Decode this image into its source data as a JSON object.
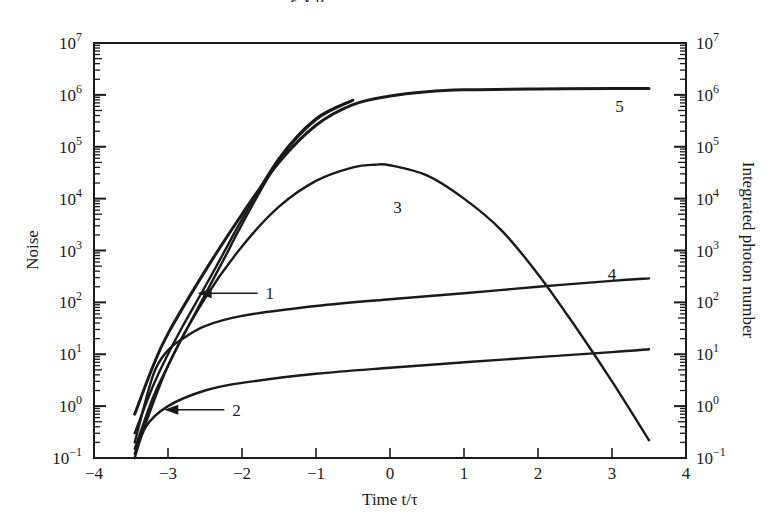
{
  "page": {
    "cut_caption": "g          y   p"
  },
  "chart_data": {
    "type": "line",
    "title": "",
    "xlabel": "Time t/τ",
    "ylabel": "Noise",
    "ylabel_right": "Integrated photon number",
    "xlim": [
      -4,
      4
    ],
    "ylim": [
      0.1,
      10000000
    ],
    "yscale": "log",
    "grid": false,
    "x_ticks": [
      "−4",
      "−3",
      "−2",
      "−1",
      "0",
      "1",
      "2",
      "3",
      "4"
    ],
    "y_ticks_left": [
      {
        "base": "10",
        "exp": "7"
      },
      {
        "base": "10",
        "exp": "6"
      },
      {
        "base": "10",
        "exp": "5"
      },
      {
        "base": "10",
        "exp": "4"
      },
      {
        "base": "10",
        "exp": "3"
      },
      {
        "base": "10",
        "exp": "2"
      },
      {
        "base": "10",
        "exp": "1"
      },
      {
        "base": "10",
        "exp": "0"
      },
      {
        "base": "10",
        "exp": "−1"
      }
    ],
    "y_ticks_right": [
      {
        "base": "10",
        "exp": "7"
      },
      {
        "base": "10",
        "exp": "6"
      },
      {
        "base": "10",
        "exp": "5"
      },
      {
        "base": "10",
        "exp": "4"
      },
      {
        "base": "10",
        "exp": "3"
      },
      {
        "base": "10",
        "exp": "2"
      },
      {
        "base": "10",
        "exp": "1"
      },
      {
        "base": "10",
        "exp": "0"
      },
      {
        "base": "10",
        "exp": "−1"
      }
    ],
    "series": [
      {
        "name": "1",
        "label": "1",
        "x": [
          -3.45,
          -3.2,
          -3.0,
          -2.8,
          -2.5,
          -2.2,
          -2.0,
          -1.5,
          -1.0,
          -0.5
        ],
        "y": [
          0.3,
          2.5,
          10,
          35,
          200,
          1200,
          4000,
          60000,
          350000,
          800000
        ]
      },
      {
        "name": "1b",
        "label": "1",
        "x": [
          -3.45,
          -3.2,
          -3.0,
          -2.8,
          -2.5,
          -2.2,
          -2.0,
          -1.5,
          -1.0,
          -0.5
        ],
        "y": [
          0.15,
          1.5,
          6,
          22,
          140,
          900,
          3200,
          55000,
          330000,
          780000
        ]
      },
      {
        "name": "2",
        "label": "2",
        "x": [
          -3.45,
          -3.3,
          -3.0,
          -2.5,
          -2.0,
          -1.0,
          0.0,
          1.0,
          2.0,
          3.0,
          3.5
        ],
        "y": [
          0.1,
          0.4,
          1.0,
          2.0,
          2.8,
          4.2,
          5.5,
          7.0,
          8.8,
          11,
          12.5
        ]
      },
      {
        "name": "3",
        "label": "3",
        "x": [
          -3.45,
          -3.0,
          -2.5,
          -2.0,
          -1.5,
          -1.0,
          -0.5,
          -0.2,
          0.0,
          0.5,
          1.0,
          1.5,
          2.0,
          2.5,
          3.0,
          3.5
        ],
        "y": [
          0.12,
          6,
          120,
          1200,
          7000,
          22000,
          40000,
          45000,
          44000,
          28000,
          10000,
          2500,
          350,
          35,
          3,
          0.22
        ]
      },
      {
        "name": "4",
        "label": "4",
        "x": [
          -3.45,
          -3.2,
          -3.0,
          -2.8,
          -2.5,
          -2.0,
          -1.0,
          0.0,
          1.0,
          2.0,
          3.0,
          3.5
        ],
        "y": [
          0.2,
          4,
          12,
          20,
          35,
          55,
          85,
          115,
          150,
          200,
          260,
          290
        ]
      },
      {
        "name": "5",
        "label": "5",
        "x": [
          -3.45,
          -3.2,
          -3.0,
          -2.5,
          -2.0,
          -1.5,
          -1.0,
          -0.5,
          0.0,
          0.5,
          1.0,
          2.0,
          3.0,
          3.5
        ],
        "y": [
          0.7,
          6,
          25,
          400,
          5000,
          50000,
          260000,
          650000,
          950000,
          1150000,
          1250000,
          1300000,
          1320000,
          1320000
        ]
      }
    ],
    "annotations": [
      {
        "text": "1",
        "arrow_to": [
          -2.6,
          150
        ]
      },
      {
        "text": "2",
        "arrow_to": [
          -3.05,
          0.85
        ]
      },
      {
        "text": "3",
        "at": [
          0.1,
          7000
        ]
      },
      {
        "text": "4",
        "at": [
          3.0,
          350
        ]
      },
      {
        "text": "5",
        "at": [
          3.1,
          600000
        ]
      }
    ]
  }
}
